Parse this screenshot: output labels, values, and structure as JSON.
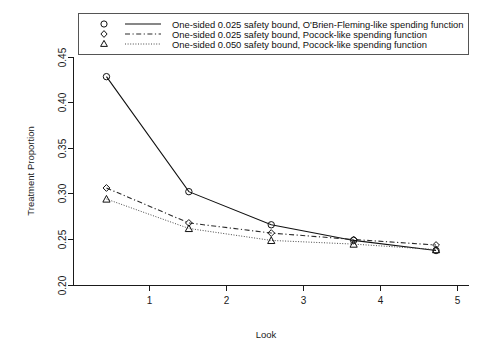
{
  "chart_data": {
    "type": "line",
    "title": "",
    "xlabel": "Look",
    "ylabel": "Treatment Proportion",
    "x": [
      1,
      2,
      3,
      4,
      5
    ],
    "xticklabels": [
      "1",
      "2",
      "3",
      "4",
      "5"
    ],
    "yticklabels": [
      "0.20",
      "0.25",
      "0.30",
      "0.35",
      "0.40",
      "0.45"
    ],
    "yticks": [
      0.2,
      0.25,
      0.3,
      0.35,
      0.4,
      0.45
    ],
    "xlim": [
      0.6,
      5.4
    ],
    "ylim": [
      0.195,
      0.462
    ],
    "grid": false,
    "legend_position": "top",
    "series": [
      {
        "name": "One-sided 0.025 safety bound, O'Brien-Fleming-like spending function",
        "marker": "circle",
        "linestyle": "solid",
        "values": [
          0.427,
          0.302,
          0.266,
          0.249,
          0.238
        ]
      },
      {
        "name": "One-sided 0.025 safety bound, Pocock-like spending function",
        "marker": "diamond",
        "linestyle": "dashdot",
        "values": [
          0.306,
          0.268,
          0.257,
          0.25,
          0.244
        ]
      },
      {
        "name": "One-sided 0.050 safety bound, Pocock-like spending function",
        "marker": "triangle",
        "linestyle": "dotted",
        "values": [
          0.294,
          0.262,
          0.249,
          0.245,
          0.239
        ]
      }
    ]
  },
  "colors": {
    "axis": "#1a1a1a",
    "series_solid": "#111111",
    "series_dashed": "#2a2a2a",
    "series_dotted": "#4a4a4a",
    "background": "#ffffff"
  }
}
